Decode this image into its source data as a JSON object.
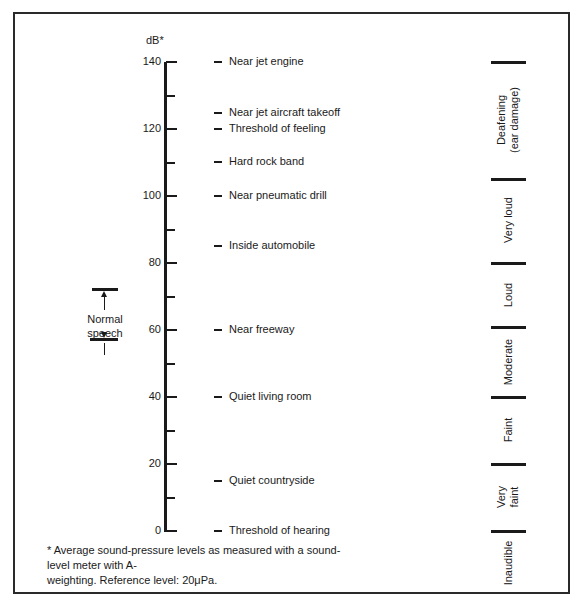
{
  "axis": {
    "unit_label": "dB*",
    "ticks": [
      {
        "value": 140,
        "label": "140"
      },
      {
        "value": 120,
        "label": "120"
      },
      {
        "value": 100,
        "label": "100"
      },
      {
        "value": 80,
        "label": "80"
      },
      {
        "value": 60,
        "label": "60"
      },
      {
        "value": 40,
        "label": "40"
      },
      {
        "value": 20,
        "label": "20"
      },
      {
        "value": 0,
        "label": "0"
      }
    ],
    "minor_ticks": [
      130,
      110,
      90,
      70,
      50,
      30,
      10
    ],
    "range": [
      0,
      140
    ]
  },
  "sources": [
    {
      "db": 140,
      "label": "Near jet engine"
    },
    {
      "db": 125,
      "label": "Near jet aircraft takeoff"
    },
    {
      "db": 120,
      "label": "Threshold of feeling"
    },
    {
      "db": 110,
      "label": "Hard rock band"
    },
    {
      "db": 100,
      "label": "Near pneumatic drill"
    },
    {
      "db": 85,
      "label": "Inside automobile"
    },
    {
      "db": 60,
      "label": "Near freeway"
    },
    {
      "db": 40,
      "label": "Quiet living room"
    },
    {
      "db": 15,
      "label": "Quiet countryside"
    },
    {
      "db": 0,
      "label": "Threshold of hearing"
    }
  ],
  "categories": [
    {
      "label": "Deafening (ear damage)",
      "line1": "Deafening",
      "line2": "(ear damage)",
      "from": 105,
      "to": 140
    },
    {
      "label": "Very loud",
      "line1": "Very loud",
      "line2": "",
      "from": 80,
      "to": 105
    },
    {
      "label": "Loud",
      "line1": "Loud",
      "line2": "",
      "from": 60,
      "to": 80
    },
    {
      "label": "Moderate",
      "line1": "Moderate",
      "line2": "",
      "from": 40,
      "to": 60
    },
    {
      "label": "Faint",
      "line1": "Faint",
      "line2": "",
      "from": 20,
      "to": 40
    },
    {
      "label": "Very faint",
      "line1": "Very",
      "line2": "faint",
      "from": 0,
      "to": 20
    },
    {
      "label": "Inaudible",
      "line1": "Inaudible",
      "line2": "",
      "from": -10,
      "to": 0
    }
  ],
  "normal_speech": {
    "line1": "Normal",
    "line2": "speech",
    "from": 48,
    "to": 72
  },
  "footnote": {
    "line1": "* Average sound-pressure levels as measured with a sound-level meter with A-",
    "line2": "weighting. Reference level: 20μPa."
  },
  "colors": {
    "ink": "#1a1a1a",
    "background": "#ffffff"
  }
}
